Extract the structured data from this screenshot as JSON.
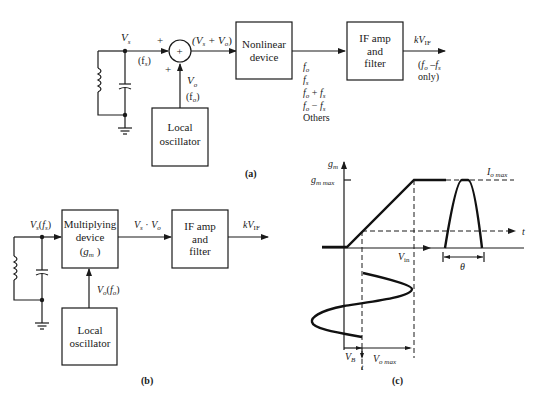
{
  "part_a": {
    "caption": "(a)",
    "input_label": "V",
    "input_sub": "s",
    "input_freq": "(f",
    "input_freq_sub": "s",
    "input_freq_close": ")",
    "plus_top": "+",
    "plus_left": "+",
    "summer_symbol": "+",
    "sum_output": "(V",
    "sum_output_s": "s",
    "sum_output_mid": " + V",
    "sum_output_o": "o",
    "sum_output_close": ")",
    "lo_signal": "V",
    "lo_signal_sub": "o",
    "lo_freq": "(f",
    "lo_freq_sub": "o",
    "lo_freq_close": ")",
    "nonlinear_box": [
      "Nonlinear",
      "device"
    ],
    "products": [
      "f_o",
      "f_s",
      "f_o + f_s",
      "f_o − f_s",
      "Others"
    ],
    "if_box": [
      "IF amp",
      "and",
      "filter"
    ],
    "output_label": "kV",
    "output_sub": "IF",
    "output_note": [
      "(f_o –f_s",
      "only)"
    ],
    "local_osc_box": [
      "Local",
      "oscillator"
    ]
  },
  "part_b": {
    "caption": "(b)",
    "input_label": "V_s(f_s)",
    "multiplier_box": [
      "Multiplying",
      "device",
      "(g_m )"
    ],
    "product_label": "V_s · V_o",
    "if_box": [
      "IF amp",
      "and",
      "filter"
    ],
    "output_label": "kV",
    "output_sub": "IF",
    "lo_signal": "V_o(f_o)",
    "local_osc_box": [
      "Local",
      "oscillator"
    ]
  },
  "part_c": {
    "caption": "(c)",
    "y_axis": "g",
    "y_axis_sub": "m",
    "y_max": "g",
    "y_max_sub": "m max",
    "current_max": "I",
    "current_max_sub": "o max",
    "time_axis_right": "t",
    "x_axis": "V",
    "x_axis_sub": "in",
    "conduction_angle": "θ",
    "bias": "V",
    "bias_sub": "B",
    "time_axis_down": "t",
    "vo_max": "V",
    "vo_max_sub": "o max"
  }
}
